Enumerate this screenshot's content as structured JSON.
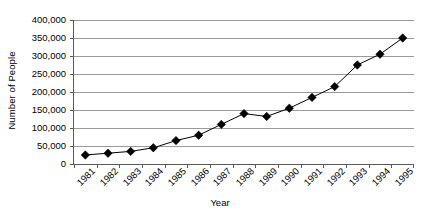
{
  "chart_data": {
    "type": "line",
    "title": "",
    "xlabel": "Year",
    "ylabel": "Number of People",
    "categories": [
      "1981",
      "1982",
      "1983",
      "1984",
      "1985",
      "1986",
      "1987",
      "1988",
      "1989",
      "1990",
      "1991",
      "1992",
      "1993",
      "1994",
      "1995"
    ],
    "values": [
      25000,
      30000,
      35000,
      45000,
      65000,
      80000,
      110000,
      140000,
      132000,
      155000,
      185000,
      215000,
      275000,
      305000,
      350000
    ],
    "series": [
      {
        "name": "Number of People",
        "values": [
          25000,
          30000,
          35000,
          45000,
          65000,
          80000,
          110000,
          140000,
          132000,
          155000,
          185000,
          215000,
          275000,
          305000,
          350000
        ]
      }
    ],
    "ylim": [
      0,
      400000
    ],
    "ytick_values": [
      0,
      50000,
      100000,
      150000,
      200000,
      250000,
      300000,
      350000,
      400000
    ],
    "ytick_labels": [
      "0",
      "50,000",
      "100,000",
      "150,000",
      "200,000",
      "250,000",
      "300,000",
      "350,000",
      "400,000"
    ],
    "xtick_labels": [
      "1981",
      "1982",
      "1983",
      "1984",
      "1985",
      "1986",
      "1987",
      "1988",
      "1989",
      "1990",
      "1991",
      "1992",
      "1993",
      "1994",
      "1995"
    ],
    "grid": "horizontal",
    "legend": "none",
    "marker": "diamond",
    "line_color": "#000000",
    "marker_color": "#000000",
    "grid_color": "#9a9a9a",
    "axis_color": "#5a5a5a",
    "background_color": "#ffffff",
    "xtick_label_rotation": -45
  }
}
